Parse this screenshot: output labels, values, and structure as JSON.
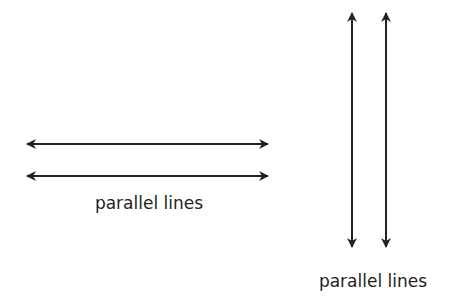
{
  "figure": {
    "horizontal_group": {
      "label": "parallel lines",
      "lines": [
        {
          "x1": 27,
          "x2": 268,
          "y": 144
        },
        {
          "x1": 27,
          "x2": 268,
          "y": 176
        }
      ]
    },
    "vertical_group": {
      "label": "parallel lines",
      "lines": [
        {
          "x": 352,
          "y1": 13,
          "y2": 247
        },
        {
          "x": 386,
          "y1": 13,
          "y2": 247
        }
      ]
    },
    "colors": {
      "stroke": "#222222",
      "background": "#ffffff"
    }
  }
}
